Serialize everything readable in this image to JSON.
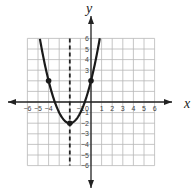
{
  "chart_data": {
    "type": "line",
    "title": "",
    "xlabel": "x",
    "ylabel": "y",
    "xlim": [
      -6,
      6
    ],
    "ylim": [
      -6,
      6
    ],
    "grid": true,
    "x_ticks": [
      "-6",
      "-5",
      "-4",
      "-1",
      "0",
      "1",
      "2",
      "3",
      "4",
      "5",
      "6"
    ],
    "y_ticks": [
      "6",
      "5",
      "4",
      "3",
      "-1",
      "-2",
      "-3",
      "-4",
      "-5",
      "-6"
    ],
    "series": [
      {
        "name": "parabola",
        "equation": "y = (x + 2)^2 - 2",
        "vertex": [
          -2,
          -2
        ],
        "marked_points": [
          [
            -4,
            2
          ],
          [
            -2,
            -2
          ],
          [
            0,
            2
          ]
        ]
      }
    ],
    "annotations": [
      {
        "type": "dashed-vertical-line",
        "label": "axis of symmetry",
        "x": -2
      }
    ]
  },
  "labels": {
    "x_axis": "x",
    "y_axis": "y"
  }
}
